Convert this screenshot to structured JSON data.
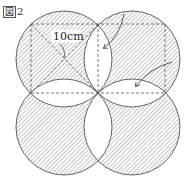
{
  "figure": {
    "label_box": "図",
    "label_number": "2"
  },
  "dimension": {
    "text": "10cm"
  },
  "geometry": {
    "center": [
      98,
      93
    ],
    "square_side_px": 68,
    "circle_radius_px": 48,
    "circles": [
      {
        "name": "top-left",
        "cx": 64,
        "cy": 59
      },
      {
        "name": "top-right",
        "cx": 132,
        "cy": 59
      },
      {
        "name": "bottom-left",
        "cx": 64,
        "cy": 127
      },
      {
        "name": "bottom-right",
        "cx": 132,
        "cy": 127
      }
    ],
    "shaded": "each circle minus its overlaps with adjacent circles",
    "unshaded_lenses": 4
  },
  "arrows": [
    {
      "name": "arrow-top",
      "from": [
        124,
        14
      ],
      "to": [
        104,
        48
      ]
    },
    {
      "name": "arrow-right",
      "from": [
        172,
        62
      ],
      "to": [
        136,
        86
      ]
    }
  ],
  "colors": {
    "stroke": "#555555",
    "hatch": "#8a8a8a",
    "dash": "#555555",
    "background": "#ffffff"
  }
}
